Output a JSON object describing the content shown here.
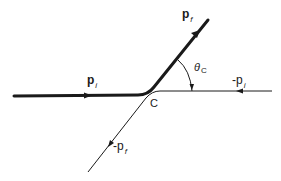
{
  "diagram": {
    "type": "momentum-scattering-diagram",
    "colors": {
      "line": "#1a1a1a",
      "background": "#ffffff"
    },
    "labels": {
      "p_f": {
        "main": "p",
        "sub": "f"
      },
      "p_i": {
        "main": "p",
        "sub": "i"
      },
      "theta_c": {
        "main": "θ",
        "sub": "C"
      },
      "neg_p_i": {
        "main": "-p",
        "sub": "i"
      },
      "neg_p_f": {
        "main": "-p",
        "sub": "f"
      },
      "vertex": "C"
    },
    "paths": [
      {
        "name": "incoming-final-thick",
        "from": "p_i",
        "to": "p_f",
        "weight": "thick"
      },
      {
        "name": "reversed-thin",
        "from": "-p_i",
        "to": "-p_f",
        "weight": "thin"
      }
    ]
  }
}
